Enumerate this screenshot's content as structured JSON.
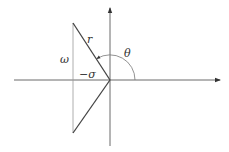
{
  "diagram": {
    "type": "s-plane pole geometry",
    "labels": {
      "r": "r",
      "theta": "θ",
      "omega": "ω",
      "neg_sigma": "−σ"
    },
    "colors": {
      "axis": "#6b6b6b",
      "line": "#444444",
      "thin": "#9a9a9a",
      "background": "#ffffff"
    }
  }
}
